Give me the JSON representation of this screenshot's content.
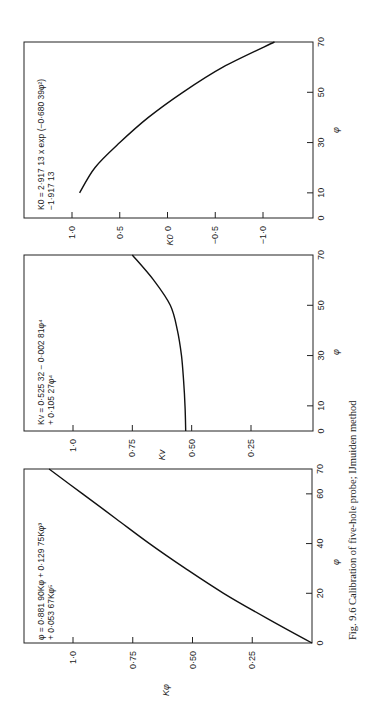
{
  "caption": "Fig. 9.6  Calibration of five-hole probe; IJmuiden method",
  "orientation": "rotated 90° counter-clockwise",
  "chart_data": [
    {
      "type": "line",
      "id": "k-phi",
      "title": "",
      "equation_line1": "φ = 0·881 90Kφ + 0·129 75Kφ³",
      "equation_line2": "+ 0·053 67Kφ⁵",
      "xlabel": "φ",
      "ylabel": "Kφ",
      "xlim": [
        0,
        70
      ],
      "ylim": [
        0,
        1.2
      ],
      "xticks": [
        0,
        20,
        40,
        60,
        70
      ],
      "xtick_labels": [
        "0",
        "20",
        "40",
        "60",
        "70"
      ],
      "yticks": [
        0.25,
        0.5,
        0.75,
        1.0
      ],
      "ytick_labels": [
        "0·25",
        "0·50",
        "0·75",
        "1·0"
      ],
      "grid": false,
      "series": [
        {
          "name": "Kφ",
          "x": [
            0,
            10,
            20,
            30,
            40,
            50,
            60,
            70
          ],
          "values": [
            0,
            0.19,
            0.37,
            0.53,
            0.68,
            0.82,
            0.96,
            1.1
          ]
        }
      ]
    },
    {
      "type": "line",
      "id": "k-v",
      "title": "",
      "equation_line1": "Kv = 0·525 32 − 0·002 81φ⁴",
      "equation_line2": "+ 0·105 27φ⁴",
      "xlabel": "φ",
      "ylabel": "Kv",
      "xlim": [
        0,
        70
      ],
      "ylim": [
        0,
        1.2
      ],
      "xticks": [
        0,
        10,
        30,
        50,
        70
      ],
      "xtick_labels": [
        "0",
        "10",
        "30",
        "50",
        "70"
      ],
      "yticks": [
        0.25,
        0.5,
        0.75,
        1.0
      ],
      "ytick_labels": [
        "0·25",
        "0·50",
        "0·75",
        "1·0"
      ],
      "grid": false,
      "series": [
        {
          "name": "Kv",
          "x": [
            0,
            10,
            20,
            30,
            40,
            50,
            60,
            70
          ],
          "values": [
            0.525,
            0.528,
            0.534,
            0.543,
            0.56,
            0.59,
            0.66,
            0.75
          ]
        }
      ]
    },
    {
      "type": "line",
      "id": "k-0",
      "title": "",
      "equation_line1": "K0 = 2·917 13 x exp (−0·680 39φ²)",
      "equation_line2": "−1·917 13",
      "xlabel": "φ",
      "ylabel": "K0",
      "xlim": [
        0,
        70
      ],
      "ylim": [
        -1.5,
        1.5
      ],
      "xticks": [
        0,
        10,
        30,
        50,
        70
      ],
      "xtick_labels": [
        "0",
        "10",
        "30",
        "50",
        "70"
      ],
      "yticks": [
        1.0,
        0.5,
        0,
        -0.5,
        -1.0
      ],
      "ytick_labels": [
        "1·0",
        "0·5",
        "0",
        "−0·5",
        "−1·0"
      ],
      "grid": false,
      "series": [
        {
          "name": "K0",
          "x": [
            10,
            20,
            30,
            40,
            50,
            60,
            70
          ],
          "values": [
            0.92,
            0.76,
            0.5,
            0.2,
            -0.16,
            -0.58,
            -1.12
          ]
        }
      ]
    }
  ]
}
